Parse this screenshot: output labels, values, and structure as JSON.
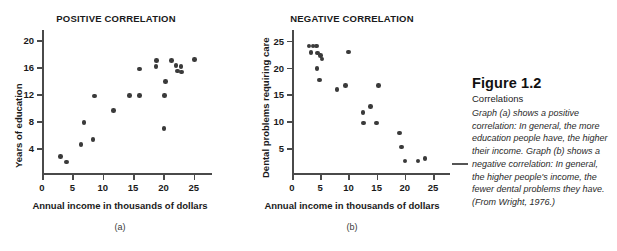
{
  "figure": {
    "number_label": "Figure 1.2",
    "subtitle": "Correlations",
    "body": "Graph (a) shows a positive correlation: In general, the more education people have, the higher their income. Graph (b) shows a negative correlation: In general, the higher people's income, the fewer dental problems they have. (From Wright, 1976.)"
  },
  "panels": {
    "a": {
      "label": "(a)"
    },
    "b": {
      "label": "(b)"
    }
  },
  "chart_data": [
    {
      "type": "scatter",
      "title": "POSITIVE CORRELATION",
      "xlabel": "Annual income in thousands of dollars",
      "ylabel": "Years of education",
      "xlim": [
        0,
        28
      ],
      "ylim": [
        0,
        21.5
      ],
      "xticks": [
        0,
        5,
        10,
        15,
        20,
        25
      ],
      "yticks": [
        4,
        8,
        12,
        16,
        20
      ],
      "xticklabels": [
        "0",
        "5",
        "10",
        "15",
        "20",
        "25"
      ],
      "yticklabels": [
        "4",
        "8",
        "12",
        "16",
        "20"
      ],
      "grid": false,
      "legend": false,
      "points": [
        [
          3.0,
          2.7
        ],
        [
          4.0,
          1.9
        ],
        [
          6.4,
          4.5
        ],
        [
          6.9,
          7.8
        ],
        [
          8.4,
          5.3
        ],
        [
          8.6,
          11.7
        ],
        [
          11.8,
          9.6
        ],
        [
          14.4,
          11.8
        ],
        [
          16.1,
          11.8
        ],
        [
          16.1,
          15.7
        ],
        [
          18.8,
          16.1
        ],
        [
          18.9,
          17.0
        ],
        [
          20.1,
          6.9
        ],
        [
          20.2,
          11.8
        ],
        [
          20.3,
          13.9
        ],
        [
          21.3,
          17.0
        ],
        [
          22.1,
          16.2
        ],
        [
          22.3,
          15.4
        ],
        [
          22.9,
          16.1
        ],
        [
          23.0,
          15.3
        ],
        [
          25.1,
          17.1
        ]
      ]
    },
    {
      "type": "scatter",
      "title": "NEGATIVE CORRELATION",
      "xlabel": "Annual income in thousands of dollars",
      "ylabel": "Dental problems requiring care",
      "xlim": [
        0,
        28
      ],
      "ylim": [
        0,
        27
      ],
      "xticks": [
        0,
        5,
        10,
        15,
        20,
        25
      ],
      "yticks": [
        5,
        10,
        15,
        20,
        25
      ],
      "xticklabels": [
        "0",
        "5",
        "10",
        "15",
        "20",
        "25"
      ],
      "yticklabels": [
        "5",
        "10",
        "15",
        "20",
        "25"
      ],
      "grid": false,
      "legend": false,
      "points": [
        [
          3.0,
          24.0
        ],
        [
          3.7,
          24.0
        ],
        [
          4.3,
          24.0
        ],
        [
          3.4,
          22.8
        ],
        [
          4.5,
          22.7
        ],
        [
          5.0,
          22.3
        ],
        [
          5.3,
          21.6
        ],
        [
          4.4,
          19.8
        ],
        [
          4.9,
          17.7
        ],
        [
          8.0,
          15.9
        ],
        [
          9.5,
          16.7
        ],
        [
          10.0,
          22.9
        ],
        [
          12.6,
          11.6
        ],
        [
          12.7,
          9.7
        ],
        [
          13.9,
          12.7
        ],
        [
          15.0,
          9.7
        ],
        [
          15.3,
          16.7
        ],
        [
          19.1,
          7.8
        ],
        [
          19.4,
          5.2
        ],
        [
          20.0,
          2.6
        ],
        [
          22.3,
          2.6
        ],
        [
          23.6,
          3.1
        ]
      ]
    }
  ]
}
